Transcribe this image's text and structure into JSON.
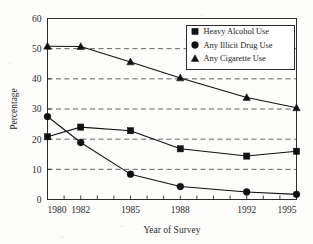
{
  "chart_data": {
    "type": "line",
    "title": "",
    "xlabel": "Year of Survey",
    "ylabel": "Percentage",
    "x": [
      1980,
      1982,
      1985,
      1988,
      1992,
      1995
    ],
    "categories": [
      "1980",
      "1982",
      "1985",
      "1988",
      "1992",
      "1995"
    ],
    "xlim": [
      1980,
      1995
    ],
    "ylim": [
      0,
      60
    ],
    "yticks": [
      0,
      10,
      20,
      30,
      40,
      50,
      60
    ],
    "ytick_labels": [
      "0",
      "10",
      "20",
      "30",
      "40",
      "50",
      "60"
    ],
    "xtick_labels": [
      "1980",
      "1982",
      "1985",
      "1988",
      "1992",
      "1995"
    ],
    "xminor_ticks": [
      1980,
      1981,
      1982,
      1983,
      1984,
      1985,
      1986,
      1987,
      1988,
      1989,
      1990,
      1991,
      1992,
      1993,
      1994,
      1995
    ],
    "grid": "horizontal-dashed",
    "gridlines_at": [
      10,
      20,
      30,
      40,
      50
    ],
    "legend_position": "upper-right-inside",
    "series": [
      {
        "name": "Heavy Alcohol Use",
        "marker": "square",
        "values": [
          20.8,
          24.0,
          22.8,
          16.8,
          14.4,
          16.0
        ]
      },
      {
        "name": "Any Illicit Drug Use",
        "marker": "circle",
        "values": [
          27.5,
          18.9,
          8.4,
          4.3,
          2.5,
          1.7
        ]
      },
      {
        "name": "Any Cigarette Use",
        "marker": "triangle",
        "values": [
          50.8,
          50.7,
          45.6,
          40.3,
          33.8,
          30.4
        ]
      }
    ],
    "colors": {
      "line": "#111111",
      "marker": "#111111",
      "grid": "#3a3a3a",
      "frame": "#2b2b2b",
      "background": "#fdfdfc"
    }
  },
  "legend": {
    "items": [
      {
        "label": "Heavy Alcohol Use",
        "marker": "square"
      },
      {
        "label": "Any Illicit Drug Use",
        "marker": "circle"
      },
      {
        "label": "Any Cigarette Use",
        "marker": "triangle"
      }
    ]
  },
  "axes": {
    "y_title": "Percentage",
    "x_title": "Year of Survey"
  }
}
